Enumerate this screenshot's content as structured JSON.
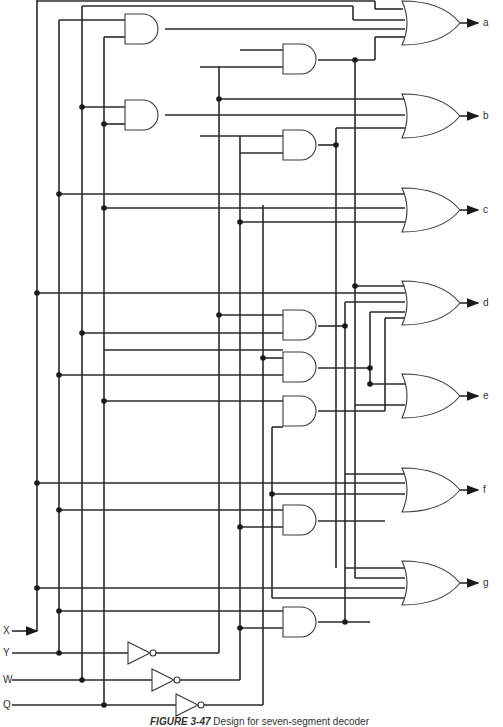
{
  "figure": {
    "caption_label": "FIGURE 3-47",
    "caption_text": "Design for seven-segment decoder"
  },
  "inputs": [
    {
      "name": "X",
      "y": 631
    },
    {
      "name": "Y",
      "y": 653
    },
    {
      "name": "W",
      "y": 680
    },
    {
      "name": "Q",
      "y": 705
    }
  ],
  "outputs": [
    {
      "name": "a",
      "y": 23
    },
    {
      "name": "b",
      "y": 116
    },
    {
      "name": "c",
      "y": 210
    },
    {
      "name": "d",
      "y": 303
    },
    {
      "name": "e",
      "y": 396
    },
    {
      "name": "f",
      "y": 490
    },
    {
      "name": "g",
      "y": 583
    }
  ],
  "buses": [
    {
      "name": "X",
      "x": 37
    },
    {
      "name": "Y",
      "x": 59
    },
    {
      "name": "W",
      "x": 82
    },
    {
      "name": "Q",
      "x": 104
    },
    {
      "name": "Y-bar",
      "x": 219
    },
    {
      "name": "W-bar",
      "x": 240
    },
    {
      "name": "Q-bar",
      "x": 263
    }
  ],
  "gate_counts": {
    "or": 7,
    "and": 10,
    "not": 3
  },
  "colors": {
    "line": "#2a2a2a",
    "background": "#ffffff"
  }
}
